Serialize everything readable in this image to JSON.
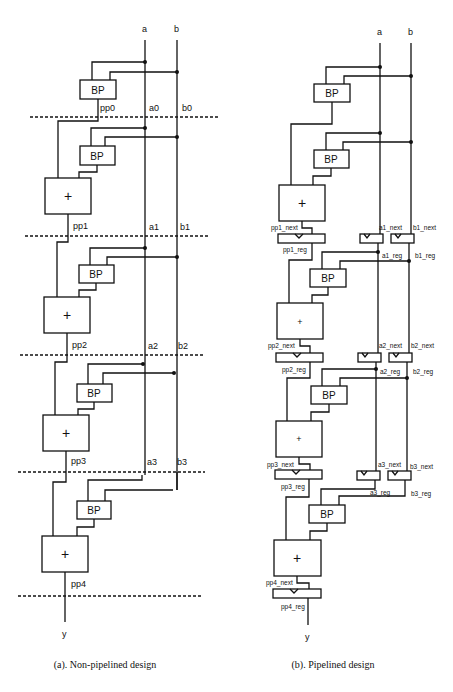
{
  "left_panel": {
    "caption": "(a). Non-pipelined design",
    "inputs": [
      "a",
      "b"
    ],
    "output": "y",
    "bp_label": "BP",
    "adder_label": "+",
    "stage_labels": {
      "pp": [
        "pp0",
        "pp1",
        "pp2",
        "pp3",
        "pp4"
      ],
      "a": [
        "a0",
        "a1",
        "a2",
        "a3"
      ],
      "b": [
        "b0",
        "b1",
        "b2",
        "b3"
      ]
    }
  },
  "right_panel": {
    "caption": "(b). Pipelined design",
    "inputs": [
      "a",
      "b"
    ],
    "output": "y",
    "bp_label": "BP",
    "adder_label": "+",
    "register_labels": {
      "pp_next": [
        "pp1_next",
        "pp2_next",
        "pp3_next",
        "pp4_next"
      ],
      "pp_reg": [
        "pp1_reg",
        "pp2_reg",
        "pp3_reg",
        "pp4_reg"
      ],
      "a_next": [
        "a1_next",
        "a2_next",
        "a3_next"
      ],
      "a_reg": [
        "a1_reg",
        "a2_reg",
        "a3_reg"
      ],
      "b_next": [
        "b1_next",
        "b2_next",
        "b3_next"
      ],
      "b_reg": [
        "b1_reg",
        "b2_reg",
        "b3_reg"
      ]
    }
  }
}
